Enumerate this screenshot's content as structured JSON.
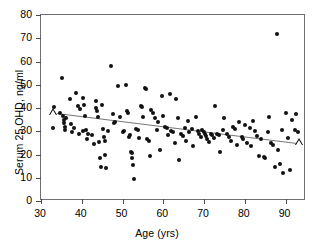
{
  "chart_data": {
    "type": "scatter",
    "title": "",
    "xlabel": "Age (yrs)",
    "ylabel": "Serum 25 OHD, ng/ml",
    "xlim": [
      30,
      95
    ],
    "ylim": [
      0,
      80
    ],
    "xticks": [
      30,
      40,
      50,
      60,
      70,
      80,
      90
    ],
    "yticks": [
      0,
      10,
      20,
      30,
      40,
      50,
      60,
      70,
      80
    ],
    "grid": false,
    "legend": null,
    "series": [
      {
        "name": "subjects",
        "marker": "filled-circle",
        "color": "#111111",
        "points": [
          [
            33.0,
            31.5
          ],
          [
            33.2,
            40.5
          ],
          [
            34.6,
            38.0
          ],
          [
            35.1,
            53.0
          ],
          [
            35.4,
            36.5
          ],
          [
            35.6,
            35.0
          ],
          [
            35.6,
            33.5
          ],
          [
            35.8,
            32.0
          ],
          [
            35.9,
            30.5
          ],
          [
            36.2,
            35.5
          ],
          [
            37.0,
            44.0
          ],
          [
            37.4,
            33.0
          ],
          [
            37.6,
            29.5
          ],
          [
            38.2,
            31.5
          ],
          [
            38.6,
            46.5
          ],
          [
            39.1,
            41.0
          ],
          [
            39.4,
            29.0
          ],
          [
            39.6,
            39.5
          ],
          [
            40.2,
            44.5
          ],
          [
            40.4,
            30.0
          ],
          [
            40.6,
            41.5
          ],
          [
            40.8,
            36.5
          ],
          [
            41.0,
            30.5
          ],
          [
            41.3,
            26.5
          ],
          [
            41.6,
            29.0
          ],
          [
            42.4,
            28.5
          ],
          [
            43.0,
            24.5
          ],
          [
            43.4,
            40.0
          ],
          [
            43.6,
            43.0
          ],
          [
            43.8,
            38.5
          ],
          [
            44.0,
            36.0
          ],
          [
            44.2,
            25.5
          ],
          [
            44.4,
            18.5
          ],
          [
            44.6,
            14.5
          ],
          [
            45.0,
            41.5
          ],
          [
            45.2,
            31.0
          ],
          [
            45.4,
            27.5
          ],
          [
            45.6,
            26.0
          ],
          [
            45.8,
            20.0
          ],
          [
            46.0,
            14.0
          ],
          [
            46.4,
            30.0
          ],
          [
            47.2,
            58.0
          ],
          [
            47.6,
            37.5
          ],
          [
            47.8,
            33.5
          ],
          [
            48.2,
            34.0
          ],
          [
            49.0,
            49.5
          ],
          [
            49.4,
            36.0
          ],
          [
            50.0,
            29.5
          ],
          [
            50.4,
            30.0
          ],
          [
            50.8,
            50.0
          ],
          [
            51.2,
            38.5
          ],
          [
            51.4,
            38.0
          ],
          [
            51.6,
            27.5
          ],
          [
            51.8,
            28.5
          ],
          [
            52.0,
            21.0
          ],
          [
            52.2,
            20.5
          ],
          [
            52.4,
            18.5
          ],
          [
            52.6,
            15.5
          ],
          [
            52.8,
            9.5
          ],
          [
            53.4,
            31.0
          ],
          [
            53.8,
            30.5
          ],
          [
            54.0,
            27.0
          ],
          [
            54.6,
            41.0
          ],
          [
            54.8,
            40.5
          ],
          [
            55.0,
            36.0
          ],
          [
            55.4,
            48.5
          ],
          [
            55.8,
            48.0
          ],
          [
            56.0,
            26.5
          ],
          [
            56.4,
            26.0
          ],
          [
            56.8,
            19.5
          ],
          [
            57.0,
            39.0
          ],
          [
            57.4,
            38.0
          ],
          [
            58.0,
            35.5
          ],
          [
            58.4,
            30.5
          ],
          [
            58.8,
            34.0
          ],
          [
            59.2,
            22.0
          ],
          [
            59.6,
            45.0
          ],
          [
            60.0,
            36.5
          ],
          [
            60.4,
            32.0
          ],
          [
            60.8,
            31.5
          ],
          [
            61.2,
            28.5
          ],
          [
            61.6,
            46.0
          ],
          [
            62.0,
            30.0
          ],
          [
            62.4,
            29.5
          ],
          [
            62.8,
            25.0
          ],
          [
            63.2,
            44.0
          ],
          [
            63.6,
            35.5
          ],
          [
            63.8,
            17.5
          ],
          [
            64.4,
            29.0
          ],
          [
            64.8,
            28.0
          ],
          [
            65.2,
            31.5
          ],
          [
            65.6,
            26.0
          ],
          [
            66.0,
            34.5
          ],
          [
            66.4,
            29.5
          ],
          [
            67.0,
            31.0
          ],
          [
            67.4,
            23.5
          ],
          [
            68.0,
            36.0
          ],
          [
            68.4,
            30.0
          ],
          [
            68.8,
            29.0
          ],
          [
            69.2,
            27.5
          ],
          [
            69.6,
            30.5
          ],
          [
            70.0,
            29.5
          ],
          [
            70.2,
            29.0
          ],
          [
            70.4,
            28.0
          ],
          [
            70.8,
            26.5
          ],
          [
            71.2,
            25.5
          ],
          [
            71.6,
            29.0
          ],
          [
            72.0,
            28.5
          ],
          [
            72.4,
            27.0
          ],
          [
            72.8,
            41.0
          ],
          [
            73.2,
            29.0
          ],
          [
            73.6,
            28.5
          ],
          [
            74.0,
            21.0
          ],
          [
            74.6,
            30.5
          ],
          [
            75.0,
            35.5
          ],
          [
            75.6,
            29.0
          ],
          [
            76.0,
            27.5
          ],
          [
            76.6,
            26.0
          ],
          [
            77.2,
            32.0
          ],
          [
            77.6,
            31.0
          ],
          [
            78.0,
            24.0
          ],
          [
            78.6,
            34.0
          ],
          [
            79.2,
            27.5
          ],
          [
            79.6,
            26.5
          ],
          [
            80.0,
            32.5
          ],
          [
            80.6,
            25.0
          ],
          [
            81.2,
            31.5
          ],
          [
            81.6,
            23.5
          ],
          [
            82.0,
            34.5
          ],
          [
            82.6,
            30.0
          ],
          [
            83.0,
            28.0
          ],
          [
            83.4,
            19.5
          ],
          [
            84.0,
            26.5
          ],
          [
            84.6,
            19.0
          ],
          [
            85.0,
            18.5
          ],
          [
            85.6,
            29.5
          ],
          [
            86.0,
            36.0
          ],
          [
            86.4,
            25.0
          ],
          [
            87.0,
            24.0
          ],
          [
            87.4,
            14.5
          ],
          [
            88.0,
            72.0
          ],
          [
            88.2,
            22.0
          ],
          [
            88.6,
            16.0
          ],
          [
            89.0,
            30.5
          ],
          [
            89.4,
            12.0
          ],
          [
            90.0,
            38.0
          ],
          [
            90.6,
            27.0
          ],
          [
            91.0,
            13.5
          ],
          [
            91.6,
            35.0
          ],
          [
            92.2,
            30.5
          ],
          [
            92.6,
            37.5
          ],
          [
            93.0,
            29.5
          ]
        ]
      },
      {
        "name": "reference-markers",
        "marker": "open-triangle",
        "color": "#000000",
        "points": [
          [
            33.0,
            38.0
          ],
          [
            93.2,
            25.0
          ]
        ]
      }
    ],
    "regression_line": {
      "x": [
        34.0,
        93.5
      ],
      "y": [
        38.0,
        25.0
      ],
      "color": "#777777"
    }
  }
}
